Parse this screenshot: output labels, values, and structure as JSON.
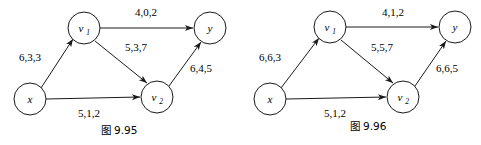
{
  "figures": [
    {
      "id": "fig-9-95",
      "caption": "图 9.95",
      "nodes": [
        {
          "id": "x",
          "label": "x",
          "sub": "",
          "cx": 30,
          "cy": 99
        },
        {
          "id": "v1",
          "label": "v",
          "sub": "1",
          "cx": 84,
          "cy": 28
        },
        {
          "id": "v2",
          "label": "v",
          "sub": "2",
          "cx": 157,
          "cy": 97
        },
        {
          "id": "y",
          "label": "y",
          "sub": "",
          "cx": 210,
          "cy": 28
        }
      ],
      "edges": [
        {
          "id": "x-v1",
          "from": "x",
          "to": "v1",
          "label": "6,3,3",
          "lx": 30,
          "ly": 61
        },
        {
          "id": "v1-y",
          "from": "v1",
          "to": "y",
          "label": "4,0,2",
          "lx": 146,
          "ly": 16
        },
        {
          "id": "v1-v2",
          "from": "v1",
          "to": "v2",
          "label": "5,3,7",
          "lx": 136,
          "ly": 51
        },
        {
          "id": "v2-y",
          "from": "v2",
          "to": "y",
          "label": "6,4,5",
          "lx": 201,
          "ly": 72
        },
        {
          "id": "x-v2",
          "from": "x",
          "to": "v2",
          "label": "5,1,2",
          "lx": 89,
          "ly": 117
        }
      ]
    },
    {
      "id": "fig-9-96",
      "caption": "图 9.96",
      "nodes": [
        {
          "id": "x",
          "label": "x",
          "sub": "",
          "cx": 30,
          "cy": 99
        },
        {
          "id": "v1",
          "label": "v",
          "sub": "1",
          "cx": 90,
          "cy": 27
        },
        {
          "id": "v2",
          "label": "v",
          "sub": "2",
          "cx": 163,
          "cy": 97
        },
        {
          "id": "y",
          "label": "y",
          "sub": "",
          "cx": 215,
          "cy": 27
        }
      ],
      "edges": [
        {
          "id": "x-v1",
          "from": "x",
          "to": "v1",
          "label": "6,6,3",
          "lx": 30,
          "ly": 61
        },
        {
          "id": "v1-y",
          "from": "v1",
          "to": "y",
          "label": "4,1,2",
          "lx": 153,
          "ly": 16
        },
        {
          "id": "v1-v2",
          "from": "v1",
          "to": "v2",
          "label": "5,5,7",
          "lx": 142,
          "ly": 51
        },
        {
          "id": "v2-y",
          "from": "v2",
          "to": "y",
          "label": "6,6,5",
          "lx": 207,
          "ly": 72
        },
        {
          "id": "x-v2",
          "from": "x",
          "to": "v2",
          "label": "5,1,2",
          "lx": 95,
          "ly": 117
        }
      ]
    }
  ],
  "style": {
    "node_radius": 16,
    "stroke_color": "#1a1a1a",
    "background": "#ffffff"
  }
}
